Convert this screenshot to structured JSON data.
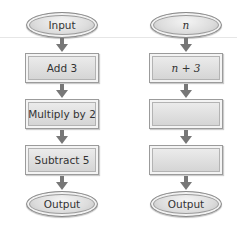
{
  "diagram": {
    "type": "flowchart",
    "colors": {
      "node_fill": "#dcdcdc",
      "node_border": "#8a8a8a",
      "arrow": "#777777",
      "text": "#333333"
    },
    "left_flowchart": {
      "start": "Input",
      "steps": [
        "Add 3",
        "Multiply by 2",
        "Subtract 5"
      ],
      "end": "Output"
    },
    "right_flowchart": {
      "start": "n",
      "steps": [
        "n + 3",
        "",
        ""
      ],
      "end": "Output"
    }
  }
}
